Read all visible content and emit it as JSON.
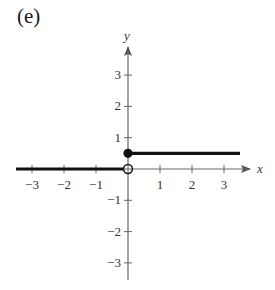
{
  "panel_label": "(e)",
  "chart_data": {
    "type": "line",
    "title": "(e)",
    "xlabel": "x",
    "ylabel": "y",
    "xlim": [
      -3.5,
      3.8
    ],
    "ylim": [
      -3.5,
      3.8
    ],
    "x_ticks": [
      -3,
      -2,
      -1,
      1,
      2,
      3
    ],
    "y_ticks": [
      -3,
      -2,
      -1,
      1,
      2,
      3
    ],
    "x_tick_labels": [
      "−3",
      "−2",
      "−1",
      "1",
      "2",
      "3"
    ],
    "y_tick_labels": [
      "3",
      "2",
      "1",
      "−1",
      "−2",
      "−3"
    ],
    "grid": false,
    "legend": null,
    "series": [
      {
        "name": "piece-left",
        "description": "y = 0 for x < 0",
        "x": [
          -3.5,
          0
        ],
        "y": [
          0,
          0
        ],
        "endpoint_right": "open"
      },
      {
        "name": "piece-right",
        "description": "y = 0.5 for x >= 0",
        "x": [
          0,
          3.5
        ],
        "y": [
          0.5,
          0.5
        ],
        "endpoint_left": "closed"
      }
    ],
    "points": [
      {
        "x": 0,
        "y": 0.5,
        "style": "filled"
      },
      {
        "x": 0,
        "y": 0,
        "style": "open"
      }
    ]
  }
}
